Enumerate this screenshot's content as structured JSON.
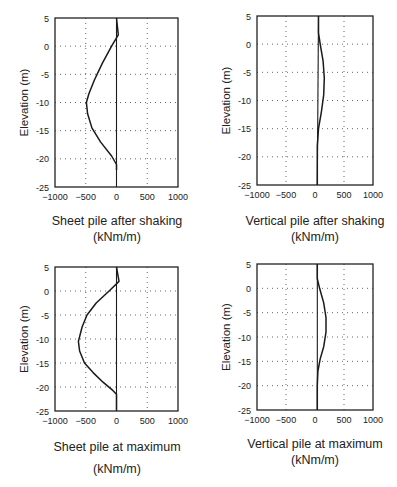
{
  "chart_data": [
    {
      "id": "sheet-after-shaking",
      "type": "line",
      "title": "Sheet pile after shaking",
      "units": "(kNm/m)",
      "xlabel": "Sheet pile after shaking (kNm/m)",
      "ylabel": "Elevation (m)",
      "xlim": [
        -1000,
        1000
      ],
      "ylim": [
        -25,
        5
      ],
      "xticks": [
        -1000,
        -500,
        0,
        500,
        1000
      ],
      "yticks": [
        5,
        0,
        -5,
        -10,
        -15,
        -20,
        -25
      ],
      "grid": "dotted",
      "series": [
        {
          "name": "bending moment",
          "x": [
            0,
            30,
            -80,
            -230,
            -360,
            -450,
            -490,
            -470,
            -400,
            -260,
            -80,
            0,
            0
          ],
          "y": [
            5,
            2,
            0,
            -3,
            -6,
            -8.5,
            -10,
            -12,
            -14.5,
            -17,
            -19.5,
            -21,
            -22
          ]
        }
      ],
      "frame_px": {
        "left": 55,
        "top": 18,
        "right": 178,
        "bottom": 187
      }
    },
    {
      "id": "vertical-after-shaking",
      "type": "line",
      "title": "Vertical pile after shaking",
      "units": "(kNm/m)",
      "xlabel": "Vertical pile after shaking (kNm/m)",
      "ylabel": "Elevation (m)",
      "xlim": [
        -1000,
        1000
      ],
      "ylim": [
        -25,
        5
      ],
      "xticks": [
        -1000,
        -500,
        0,
        500,
        1000
      ],
      "yticks": [
        5,
        0,
        -5,
        -10,
        -15,
        -20,
        -25
      ],
      "grid": "dotted",
      "series": [
        {
          "name": "bending moment",
          "x": [
            60,
            60,
            90,
            140,
            160,
            150,
            110,
            60,
            40,
            40,
            40
          ],
          "y": [
            5,
            2,
            0,
            -3,
            -6,
            -9,
            -12,
            -15,
            -18,
            -22,
            -25
          ]
        }
      ],
      "frame_px": {
        "left": 257,
        "top": 16,
        "right": 373,
        "bottom": 185
      }
    },
    {
      "id": "sheet-at-maximum",
      "type": "line",
      "title": "Sheet pile at maximum",
      "units": "(kNm/m)",
      "xlabel": "Sheet pile at maximum (kNm/m)",
      "ylabel": "Elevation (m)",
      "xlim": [
        -1000,
        1000
      ],
      "ylim": [
        -25,
        5
      ],
      "xticks": [
        -1000,
        -500,
        0,
        500,
        1000
      ],
      "yticks": [
        5,
        0,
        -5,
        -10,
        -15,
        -20,
        -25
      ],
      "grid": "dotted",
      "series": [
        {
          "name": "bending moment",
          "x": [
            0,
            40,
            -120,
            -330,
            -480,
            -560,
            -620,
            -600,
            -520,
            -380,
            -220,
            -60,
            0,
            0
          ],
          "y": [
            5,
            2,
            0,
            -2.5,
            -5,
            -7.5,
            -10.5,
            -12.5,
            -15,
            -17,
            -19,
            -20.7,
            -21.5,
            -25
          ]
        }
      ],
      "frame_px": {
        "left": 55,
        "top": 267,
        "right": 178,
        "bottom": 411
      }
    },
    {
      "id": "vertical-at-maximum",
      "type": "line",
      "title": "Vertical pile at maximum",
      "units": "(kNm/m)",
      "xlabel": "Vertical pile at maximum (kNm/m)",
      "ylabel": "Elevation (m)",
      "xlim": [
        -1000,
        1000
      ],
      "ylim": [
        -25,
        5
      ],
      "xticks": [
        -1000,
        -500,
        0,
        500,
        1000
      ],
      "yticks": [
        5,
        0,
        -5,
        -10,
        -15,
        -20,
        -25
      ],
      "grid": "dotted",
      "series": [
        {
          "name": "bending moment",
          "x": [
            40,
            40,
            80,
            150,
            190,
            190,
            150,
            90,
            50,
            40,
            40
          ],
          "y": [
            5,
            2,
            0,
            -3,
            -6,
            -9,
            -12,
            -14.5,
            -17,
            -20,
            -25
          ]
        }
      ],
      "frame_px": {
        "left": 257,
        "top": 264,
        "right": 373,
        "bottom": 410
      }
    }
  ],
  "captions": [
    {
      "line1": "Sheet pile after shaking",
      "line2": "(kNm/m)"
    },
    {
      "line1": "Vertical pile after shaking",
      "line2": "(kNm/m)"
    },
    {
      "line1": "Sheet pile at maximum",
      "line2": "(kNm/m)"
    },
    {
      "line1": "Vertical pile at maximum",
      "line2": "(kNm/m)"
    }
  ],
  "axis": {
    "ylabel": "Elevation (m)",
    "xtick_labels": [
      "−1000",
      "−500",
      "0",
      "500",
      "1000"
    ],
    "ytick_labels": [
      "5",
      "0",
      "-5",
      "-10",
      "-15",
      "-20",
      "-25"
    ]
  },
  "colors": {
    "line": "#1a1a1a",
    "grid": "#555555",
    "frame": "#222222"
  }
}
